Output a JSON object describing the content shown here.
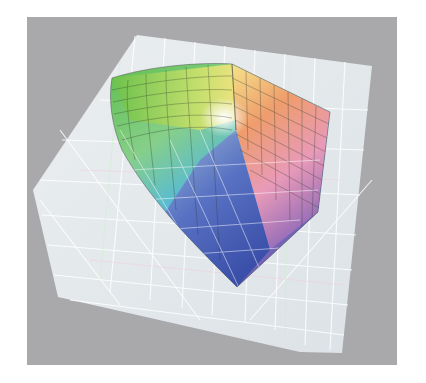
{
  "image": {
    "subject": "3D color gamut solid inside translucent gridded box",
    "description": "Photographed printout of a 3D color-space gamut volume rendered with a wireframe mesh over a gray background"
  },
  "colors": {
    "page_background": "#ffffff",
    "frame_background": "#a9a9ac",
    "box_fill": "#e4eaee",
    "grid_line": "#ffffff",
    "mesh_line": "#3a3a3a",
    "gamut_green": "#5dbb46",
    "gamut_yellow": "#f2e27a",
    "gamut_orange": "#ee9a6a",
    "gamut_pink": "#e79ab7",
    "gamut_white": "#fbfbf4",
    "gamut_cyan": "#4fb6e2",
    "gamut_blue": "#3e54b0",
    "gamut_violet": "#7560b0"
  }
}
